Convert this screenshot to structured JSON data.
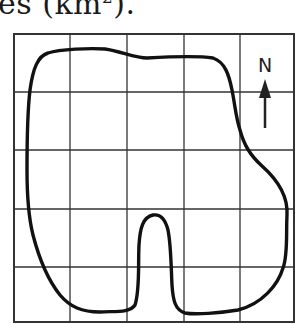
{
  "caption": {
    "text_prefix": "es (km",
    "superscript": "2",
    "text_suffix": ")."
  },
  "map": {
    "grid": {
      "columns": 5,
      "rows": 5,
      "cell_unit": "1 km²",
      "line_color": "#333333"
    },
    "outline_color": "#111111",
    "compass": {
      "label": "N",
      "direction": "north-up"
    }
  }
}
